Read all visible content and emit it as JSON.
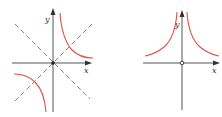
{
  "figures": [
    {
      "id": "left",
      "description": "Hyperbola y = 1/x with dashed lines y = x and y = -x",
      "x_label": "x",
      "y_label": "y",
      "curve_color": "#e0504a",
      "axis_color": "#555555",
      "dashed_color": "#777777"
    },
    {
      "id": "right",
      "description": "Curve y = 1/x^2 with open circle at origin",
      "x_label": "x",
      "y_label": "y",
      "curve_color": "#e0504a",
      "axis_color": "#555555"
    }
  ]
}
